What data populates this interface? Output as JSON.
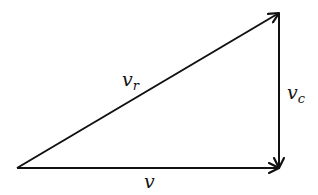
{
  "diagram": {
    "type": "vector-triangle",
    "vertices": {
      "origin": [
        17,
        168
      ],
      "bottom_right": [
        279,
        168
      ],
      "top_right": [
        279,
        13
      ]
    },
    "vectors": [
      {
        "id": "v",
        "label": "v",
        "subscript": "",
        "from": "origin",
        "to": "bottom_right"
      },
      {
        "id": "v_r",
        "label": "v",
        "subscript": "r",
        "from": "origin",
        "to": "top_right"
      },
      {
        "id": "v_c",
        "label": "v",
        "subscript": "c",
        "from": "top_right",
        "to": "bottom_right"
      }
    ],
    "stroke_color": "#111111",
    "background": "#ffffff"
  }
}
